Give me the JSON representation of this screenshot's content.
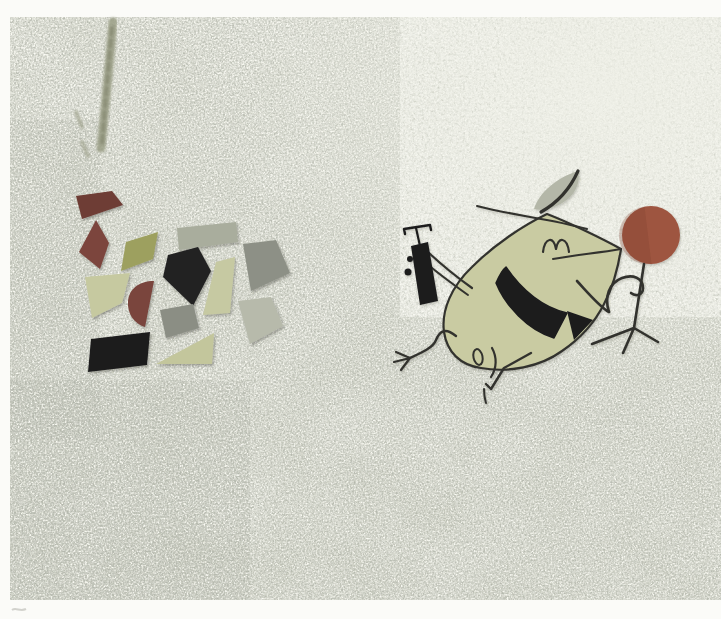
{
  "artwork": {
    "kind": "photographed painting",
    "subject": "Mid-century cartoon concept painting: whimsical long-nosed character with leaf hat kneeling, holding a black pump, beside a rust ball on a tripod stand; scattered painted shards at left on speckled canvas",
    "palette": {
      "border": "#fbfbf8",
      "canvas_top": "#d8dacd",
      "canvas_mid": "#cbcec0",
      "canvas_bottom": "#c2c5b6",
      "speck_dark": "#6f7264",
      "speck_light": "#f7f8ef",
      "smudge": "#9a9d85",
      "smudge_dark": "#83866f",
      "outline": "#33332e",
      "black": "#1c1c1e",
      "body": "#c9cba2",
      "hat": "#b4b7a8",
      "ball": "#9e5540",
      "ball_shade": "#7e4030",
      "faint_mark": "#c8c8c2"
    },
    "shards": [
      {
        "name": "shard-maroon-quad",
        "color": "#6e3c34",
        "points": "76,196 112,191 123,205 82,219"
      },
      {
        "name": "shard-maroon-kite",
        "color": "#7c453c",
        "points": "96,220 109,243 100,269 79,252"
      },
      {
        "name": "shard-olive-parallelogram",
        "color": "#9da05f",
        "points": "126,242 158,232 153,259 121,271"
      },
      {
        "name": "shard-sage-rectangle",
        "color": "#a9ad9d",
        "points": "177,228 236,222 238,242 179,250"
      },
      {
        "name": "shard-black-pentagon",
        "color": "#222224",
        "points": "168,255 198,247 211,271 193,306 163,277"
      },
      {
        "name": "shard-gray-kite",
        "color": "#8d9086",
        "points": "243,244 276,240 290,273 251,291"
      },
      {
        "name": "shard-pale-tall-quad",
        "color": "#c6c9a2",
        "points": "216,262 235,257 230,313 203,315"
      },
      {
        "name": "shard-pale-quad",
        "color": "#c6c9a0",
        "points": "85,277 130,273 122,303 92,318"
      },
      {
        "name": "shard-maroon-semicircle",
        "color": "#7a443c",
        "path": "M154,281 L145,327 C134,324 127,313 128,301 C129,289 139,281 154,281 Z"
      },
      {
        "name": "shard-gray-small-quad",
        "color": "#8b8e84",
        "points": "160,310 193,304 199,328 166,338"
      },
      {
        "name": "shard-light-diamond",
        "color": "#b7baab",
        "points": "238,301 271,297 283,326 250,344"
      },
      {
        "name": "shard-black-parallelogram",
        "color": "#1d1d1f",
        "points": "91,339 150,332 147,365 88,372"
      },
      {
        "name": "shard-pale-triangle",
        "color": "#c3c69c",
        "points": "156,364 214,333 212,364"
      }
    ]
  }
}
